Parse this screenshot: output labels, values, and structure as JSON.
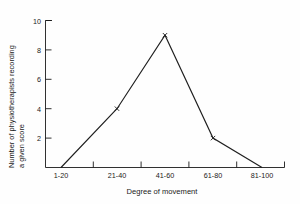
{
  "chart_data": {
    "type": "line",
    "title": "",
    "subtitle": "",
    "xlabel": "Degree of movement",
    "ylabel": "Number of physiotherapists recording a given score",
    "ylabel_line1": "Number of physiotherapists recording",
    "ylabel_line2": "a given score",
    "categories": [
      "1-20",
      "21-40",
      "41-60",
      "61-80",
      "81-100"
    ],
    "values": [
      0,
      4,
      9,
      2,
      0
    ],
    "ylim": [
      0,
      10
    ],
    "yticks": [
      0,
      2,
      4,
      6,
      8,
      10
    ],
    "ytick_labels": [
      "",
      "2",
      "4",
      "6",
      "8",
      "10"
    ],
    "grid": false,
    "legend": null,
    "marker": "x",
    "line_color": "#1f1f1f",
    "background_color": "#fefefe",
    "axis_color": "#1a1a1a"
  },
  "axes": {
    "x_tick_labels": [
      "1-20",
      "21-40",
      "41-60",
      "61-80",
      "81-100"
    ],
    "y_tick_labels": [
      "2",
      "4",
      "6",
      "8",
      "10"
    ],
    "x_title": "Degree of movement",
    "y_title_line1": "Number of physiotherapists recording",
    "y_title_line2": "a given score"
  }
}
